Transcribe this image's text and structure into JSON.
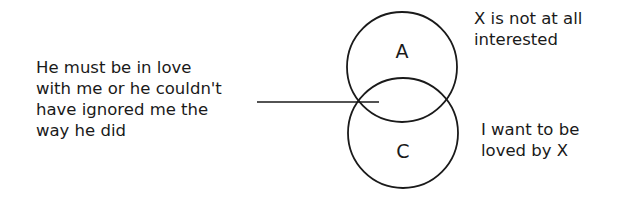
{
  "diagram": {
    "left_statement": {
      "lines": [
        "He must be in love",
        "with me or he couldn't",
        "have ignored me the",
        "way he did"
      ]
    },
    "circles": [
      {
        "label": "A",
        "description_lines": [
          "X is not at all",
          "interested"
        ]
      },
      {
        "label": "C",
        "description_lines": [
          "I want to be",
          "loved by X"
        ]
      }
    ],
    "connector": "line from left statement to the intersection of circles A and C"
  }
}
